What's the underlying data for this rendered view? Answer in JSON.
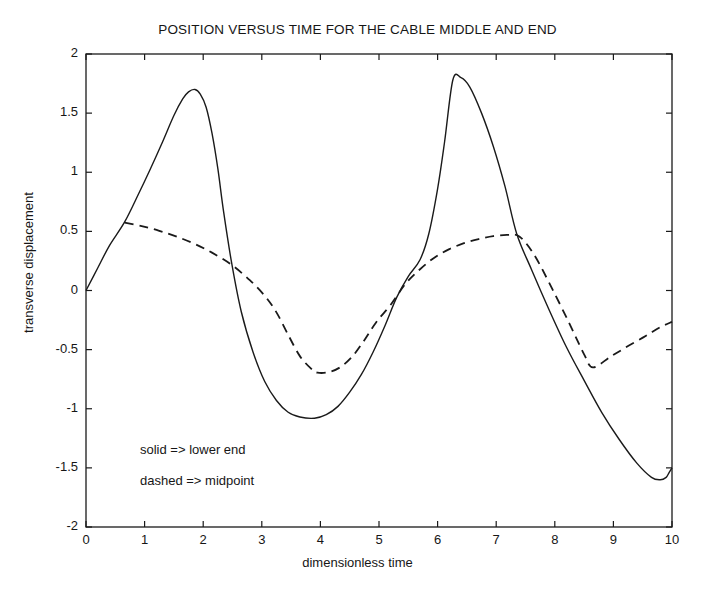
{
  "chart_data": {
    "type": "line",
    "title": "POSITION VERSUS TIME FOR THE CABLE MIDDLE AND END",
    "xlabel": "dimensionless time",
    "ylabel": "transverse displacement",
    "xlim": [
      0,
      10
    ],
    "ylim": [
      -2,
      2
    ],
    "xticks": [
      "0",
      "1",
      "2",
      "3",
      "4",
      "5",
      "6",
      "7",
      "8",
      "9",
      "10"
    ],
    "xtick_values": [
      0,
      1,
      2,
      3,
      4,
      5,
      6,
      7,
      8,
      9,
      10
    ],
    "yticks": [
      "2",
      "1.5",
      "1",
      "0.5",
      "0",
      "-0.5",
      "-1",
      "-1.5",
      "-2"
    ],
    "ytick_values": [
      2,
      1.5,
      1,
      0.5,
      0,
      -0.5,
      -1,
      -1.5,
      -2
    ],
    "grid": false,
    "legend_position": "lower-left-inside",
    "annotations": [
      "solid  => lower end",
      "dashed => midpoint"
    ],
    "series": [
      {
        "name": "lower end",
        "style": "solid",
        "color": "#1a1a1a",
        "x": [
          0.0,
          0.2,
          0.4,
          0.66,
          0.9,
          1.1,
          1.3,
          1.5,
          1.65,
          1.75,
          1.86,
          1.95,
          2.05,
          2.15,
          2.25,
          2.35,
          2.49,
          2.65,
          2.85,
          3.05,
          3.25,
          3.45,
          3.65,
          3.9,
          4.1,
          4.3,
          4.5,
          4.7,
          4.9,
          5.1,
          5.3,
          5.5,
          5.7,
          5.85,
          6.0,
          6.12,
          6.26,
          6.4,
          6.55,
          6.75,
          6.95,
          7.15,
          7.35,
          7.6,
          7.9,
          8.2,
          8.5,
          8.8,
          9.1,
          9.4,
          9.65,
          9.8,
          9.9,
          9.95,
          10.0
        ],
        "y": [
          0.0,
          0.19,
          0.38,
          0.58,
          0.82,
          1.03,
          1.25,
          1.48,
          1.62,
          1.68,
          1.7,
          1.66,
          1.55,
          1.33,
          1.03,
          0.66,
          0.22,
          -0.18,
          -0.52,
          -0.77,
          -0.93,
          -1.03,
          -1.07,
          -1.08,
          -1.05,
          -0.98,
          -0.86,
          -0.71,
          -0.52,
          -0.3,
          -0.06,
          0.12,
          0.26,
          0.48,
          0.86,
          1.26,
          1.78,
          1.8,
          1.72,
          1.5,
          1.22,
          0.88,
          0.48,
          0.18,
          -0.16,
          -0.48,
          -0.76,
          -1.03,
          -1.26,
          -1.46,
          -1.58,
          -1.6,
          -1.58,
          -1.54,
          -1.5
        ]
      },
      {
        "name": "midpoint",
        "style": "dashed",
        "color": "#1a1a1a",
        "x": [
          0.66,
          0.95,
          1.25,
          1.55,
          1.85,
          2.15,
          2.49,
          2.8,
          3.05,
          3.25,
          3.45,
          3.65,
          3.85,
          3.95,
          4.15,
          4.35,
          4.55,
          4.75,
          4.95,
          5.2,
          5.45,
          5.7,
          5.95,
          6.2,
          6.45,
          6.7,
          6.95,
          7.2,
          7.4,
          7.65,
          7.95,
          8.25,
          8.5,
          8.65,
          8.95,
          9.25,
          9.55,
          9.8,
          10.0
        ],
        "y": [
          0.575,
          0.545,
          0.505,
          0.455,
          0.395,
          0.32,
          0.215,
          0.085,
          -0.045,
          -0.185,
          -0.375,
          -0.555,
          -0.665,
          -0.695,
          -0.69,
          -0.645,
          -0.555,
          -0.42,
          -0.27,
          -0.12,
          0.055,
          0.18,
          0.28,
          0.35,
          0.4,
          0.435,
          0.46,
          0.47,
          0.455,
          0.3,
          0.02,
          -0.28,
          -0.54,
          -0.65,
          -0.56,
          -0.47,
          -0.385,
          -0.31,
          -0.265
        ]
      }
    ]
  },
  "axes": {
    "frame_color": "#1a1a1a"
  }
}
